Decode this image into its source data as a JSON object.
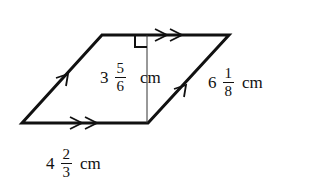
{
  "figure": {
    "shape": "parallelogram",
    "stroke_color": "#111111",
    "background": "#ffffff",
    "vertices": {
      "bottom_left": [
        22,
        123
      ],
      "top_left": [
        102,
        35
      ],
      "top_right": [
        229,
        35
      ],
      "bottom_right": [
        148,
        123
      ]
    },
    "height_line": {
      "x": 147,
      "y1": 35,
      "y2": 123,
      "right_angle_marker": true
    },
    "parallel_marks": {
      "horizontal_sides": "double-arrow",
      "slanted_sides": "single-arrow"
    }
  },
  "labels": {
    "height": {
      "whole": "3",
      "numerator": "5",
      "denominator": "6",
      "unit": "cm"
    },
    "slant_side": {
      "whole": "6",
      "numerator": "1",
      "denominator": "8",
      "unit": "cm"
    },
    "base": {
      "whole": "4",
      "numerator": "2",
      "denominator": "3",
      "unit": "cm"
    }
  }
}
